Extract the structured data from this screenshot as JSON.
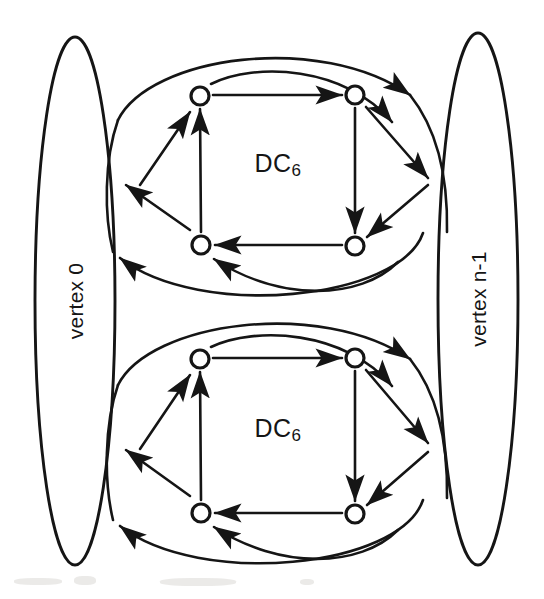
{
  "figure": {
    "kind": "directed-graph-diagram",
    "canvas": {
      "width": 544,
      "height": 599,
      "background": "#ffffff"
    },
    "ink_color": "#151515"
  },
  "vertices": [
    {
      "id": "vertex-left",
      "label": "vertex 0",
      "shape": "ellipse",
      "center": {
        "x": 75,
        "y": 301
      },
      "radius": {
        "x": 40,
        "y": 264
      },
      "label_rotation": -90
    },
    {
      "id": "vertex-right",
      "label": "vertex n-1",
      "shape": "ellipse",
      "center": {
        "x": 478,
        "y": 299
      },
      "radius": {
        "x": 40,
        "y": 266
      },
      "label_rotation": -90
    }
  ],
  "clusters": [
    {
      "id": "cluster-top",
      "label_main": "DC",
      "label_sub": "6",
      "label_center": {
        "x": 278,
        "y": 163
      },
      "nodes": [
        {
          "id": "t-tl",
          "x": 200,
          "y": 96
        },
        {
          "id": "t-tr",
          "x": 355,
          "y": 95
        },
        {
          "id": "t-bl",
          "x": 201,
          "y": 245
        },
        {
          "id": "t-br",
          "x": 355,
          "y": 246
        }
      ],
      "internal_edges": [
        {
          "from": "t-tl",
          "to": "t-tr",
          "direction": "right"
        },
        {
          "from": "t-tr",
          "to": "t-br",
          "direction": "down"
        },
        {
          "from": "t-br",
          "to": "t-bl",
          "direction": "left"
        },
        {
          "from": "t-bl",
          "to": "t-tl",
          "direction": "up"
        }
      ]
    },
    {
      "id": "cluster-bottom",
      "label_main": "DC",
      "label_sub": "6",
      "label_center": {
        "x": 278,
        "y": 428
      },
      "nodes": [
        {
          "id": "b-tl",
          "x": 200,
          "y": 359
        },
        {
          "id": "b-tr",
          "x": 355,
          "y": 358
        },
        {
          "id": "b-bl",
          "x": 201,
          "y": 513
        },
        {
          "id": "b-br",
          "x": 355,
          "y": 514
        }
      ],
      "internal_edges": [
        {
          "from": "b-tl",
          "to": "b-tr",
          "direction": "right"
        },
        {
          "from": "b-tr",
          "to": "b-br",
          "direction": "down"
        },
        {
          "from": "b-br",
          "to": "b-bl",
          "direction": "left"
        },
        {
          "from": "b-bl",
          "to": "b-tl",
          "direction": "up"
        }
      ]
    }
  ],
  "external_links": {
    "description": "curved and straight arcs linking each DC6 cluster to the vertex 0 and vertex n-1 ellipses",
    "count_per_cluster": 8
  },
  "node_style": {
    "radius": 9,
    "stroke_width": 3.2,
    "fill": "#ffffff"
  },
  "edge_style": {
    "stroke_width": 2.6,
    "arrow_length": 15,
    "arrow_width": 7
  }
}
